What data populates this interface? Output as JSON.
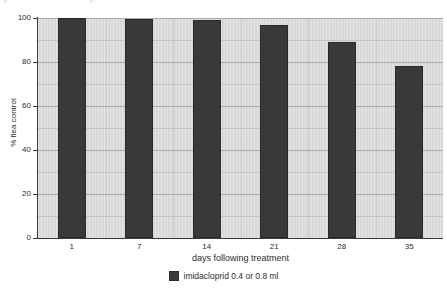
{
  "chart_data": {
    "type": "bar",
    "title": "",
    "subtitle": "",
    "xlabel": "days following treatment",
    "ylabel": "% flea control",
    "categories": [
      "1",
      "7",
      "14",
      "21",
      "28",
      "35"
    ],
    "values": [
      100,
      99.5,
      99,
      97,
      89,
      78
    ],
    "series": [
      {
        "name": "imidacloprid 0.4 or 0.8 ml",
        "values": [
          100,
          99.5,
          99,
          97,
          89,
          78
        ],
        "color": "#393939"
      }
    ],
    "ylim": [
      0,
      100
    ],
    "yticks": [
      0,
      20,
      40,
      60,
      80,
      100
    ],
    "ytick_labels": [
      "0",
      "20",
      "40",
      "60",
      "80",
      "100"
    ],
    "xtick_labels": [
      "1",
      "7",
      "14",
      "21",
      "28",
      "35"
    ],
    "grid": true,
    "grid_axis": "both",
    "legend_position": "bottom-center",
    "legend": [
      {
        "label": "imidacloprid 0.4 or 0.8 ml",
        "color": "#393939"
      }
    ],
    "plot_background": "#d8d8d8",
    "figure_background": "#ffffff",
    "bar_color": "#393939",
    "axis_color": "#3a3a3a",
    "gridline_color": "#a9a9a9"
  },
  "axes": {
    "y_title": "% flea control",
    "x_title": "days following treatment"
  },
  "legend": {
    "label": "imidacloprid 0.4 or 0.8 ml"
  }
}
